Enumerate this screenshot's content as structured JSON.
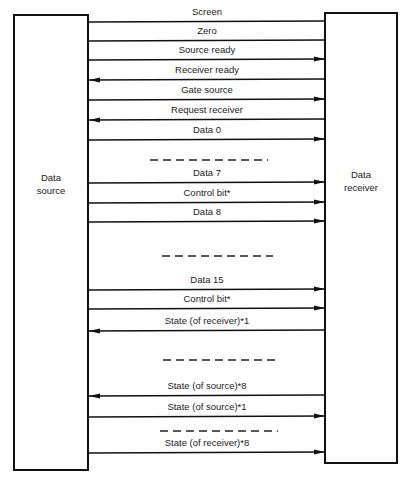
{
  "diagram": {
    "source": {
      "label_line1": "Data",
      "label_line2": "source"
    },
    "receiver": {
      "label_line1": "Data",
      "label_line2": "receiver"
    },
    "signals": [
      {
        "label": "Screen",
        "direction": "none",
        "y": 22
      },
      {
        "label": "Zero",
        "direction": "none",
        "y": 41
      },
      {
        "label": "Source ready",
        "direction": "to-receiver",
        "y": 60
      },
      {
        "label": "Receiver ready",
        "direction": "to-source",
        "y": 80
      },
      {
        "label": "Gate source",
        "direction": "to-receiver",
        "y": 100
      },
      {
        "label": "Request receiver",
        "direction": "to-source",
        "y": 120
      },
      {
        "label": "Data 0",
        "direction": "to-receiver",
        "y": 140
      },
      {
        "label": "Data 7",
        "direction": "to-receiver",
        "y": 183
      },
      {
        "label": "Control bit*",
        "direction": "to-receiver",
        "y": 203
      },
      {
        "label": "Data 8",
        "direction": "to-receiver",
        "y": 222
      },
      {
        "label": "Data 15",
        "direction": "to-receiver",
        "y": 290
      },
      {
        "label": "Control bit*",
        "direction": "to-receiver",
        "y": 309
      },
      {
        "label": "State (of receiver)*1",
        "direction": "to-source",
        "y": 331
      },
      {
        "label": "State (of source)*8",
        "direction": "to-source",
        "y": 396
      },
      {
        "label": "State (of source)*1",
        "direction": "to-receiver",
        "y": 417
      },
      {
        "label": "State (of receiver)*8",
        "direction": "to-receiver",
        "y": 453
      }
    ],
    "ellipses": [
      {
        "y": 160,
        "x1": 150,
        "x2": 268
      },
      {
        "y": 256,
        "x1": 162,
        "x2": 273
      },
      {
        "y": 360,
        "x1": 163,
        "x2": 275
      },
      {
        "y": 431,
        "x1": 160,
        "x2": 278
      }
    ]
  }
}
